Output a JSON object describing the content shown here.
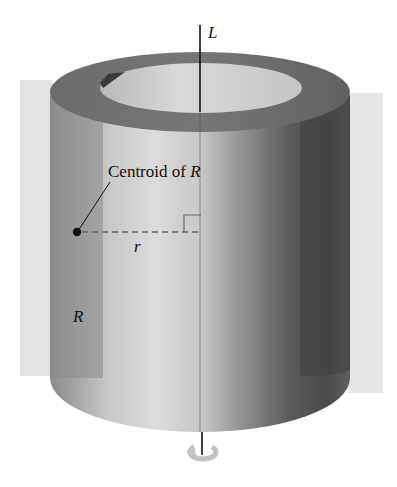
{
  "figure": {
    "axis_label": "L",
    "centroid_label_text": "Centroid of ",
    "centroid_label_var": "R",
    "distance_label": "r",
    "region_label": "R",
    "rotation_icon": "rotation-arrow-icon"
  },
  "colors": {
    "background": "#ffffff",
    "plane": "#e4e4e4",
    "cylinder_light": "#d8d8d8",
    "cylinder_mid": "#a9a9a9",
    "cylinder_dark": "#4a4a4a",
    "top_ring": "#6e6e6e",
    "inner_hole": "#cfcfcf",
    "axis": "#111111",
    "dashed_line": "#666666"
  }
}
